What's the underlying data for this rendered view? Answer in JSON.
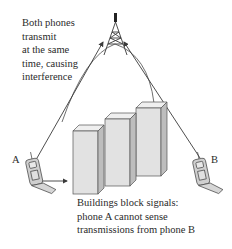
{
  "diagram": {
    "top_caption": [
      "Both phones",
      "transmit",
      "at the same",
      "time, causing",
      "interference"
    ],
    "bottom_caption": [
      "Buildings block signals:",
      "phone A cannot sense",
      "transmissions from phone B"
    ],
    "phone_a_label": "A",
    "phone_b_label": "B",
    "elements": {
      "tower": "cell-tower-icon",
      "phone_a": "mobile-phone-icon",
      "phone_b": "mobile-phone-icon",
      "buildings": "buildings-block"
    },
    "colors": {
      "stroke": "#3a3a3a",
      "building_front": "#e2e2e2",
      "building_side": "#bdbdbd",
      "building_top": "#efefef",
      "text": "#2a2a2a"
    }
  }
}
